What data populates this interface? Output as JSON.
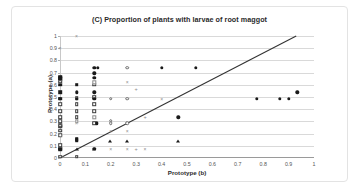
{
  "chart_data": {
    "type": "scatter",
    "title": "(C) Proportion of plants with larvae of root maggot",
    "xlabel": "Prototype (b)",
    "ylabel": "Prototype (a)",
    "xlim": [
      0,
      1
    ],
    "ylim": [
      0,
      1
    ],
    "xticks": [
      "0",
      "0.1",
      "0.2",
      "0.3",
      "0.4",
      "0.5",
      "0.6",
      "0.7",
      "0.8",
      "0.9",
      "1"
    ],
    "yticks": [
      "0",
      "0.1",
      "0.2",
      "0.3",
      "0.4",
      "0.5",
      "0.6",
      "0.7",
      "0.8",
      "0.9",
      "1"
    ],
    "xtick_values": [
      0,
      0.1,
      0.2,
      0.3,
      0.4,
      0.5,
      0.6,
      0.7,
      0.8,
      0.9,
      1
    ],
    "ytick_values": [
      0,
      0.1,
      0.2,
      0.3,
      0.4,
      0.5,
      0.6,
      0.7,
      0.8,
      0.9,
      1
    ],
    "grid": "horizontal",
    "legend": "none",
    "reference_line": {
      "name": "one-to-one-line",
      "from": [
        0,
        0
      ],
      "to": [
        0.93,
        1.0
      ],
      "color": "#333333"
    },
    "series": [
      {
        "name": "filled-squares",
        "marker": "m-filled-sq",
        "points": [
          [
            0,
            0.665
          ],
          [
            0,
            0.655
          ],
          [
            0,
            0.645
          ],
          [
            0,
            0.6
          ],
          [
            0,
            0.54
          ],
          [
            0,
            0.485
          ],
          [
            0,
            0.27
          ],
          [
            0,
            0.255
          ],
          [
            0,
            0.075
          ],
          [
            0,
            0.07
          ],
          [
            0.065,
            0.6
          ],
          [
            0.065,
            0.155
          ],
          [
            0.065,
            0.145
          ]
        ]
      },
      {
        "name": "open-squares",
        "marker": "m-open-sq",
        "points": [
          [
            0,
            0.625
          ],
          [
            0,
            0.44
          ],
          [
            0,
            0.385
          ],
          [
            0,
            0.335
          ],
          [
            0,
            0.3
          ],
          [
            0,
            0.265
          ],
          [
            0,
            0.225
          ],
          [
            0,
            0.185
          ],
          [
            0,
            0.105
          ],
          [
            0,
            0.012
          ],
          [
            0.065,
            0.49
          ],
          [
            0.065,
            0.44
          ],
          [
            0.065,
            0.385
          ],
          [
            0.065,
            0.335
          ],
          [
            0.065,
            0.012
          ],
          [
            0.135,
            0.6
          ],
          [
            0.135,
            0.5
          ],
          [
            0.135,
            0.44
          ],
          [
            0.135,
            0.385
          ],
          [
            0.135,
            0.285
          ]
        ]
      },
      {
        "name": "filled-circles",
        "marker": "m-filled-ci",
        "points": [
          [
            0,
            0.485
          ],
          [
            0.065,
            0.54
          ],
          [
            0.065,
            0.485
          ],
          [
            0.135,
            0.74
          ],
          [
            0.15,
            0.74
          ],
          [
            0.135,
            0.695
          ],
          [
            0.135,
            0.655
          ],
          [
            0.135,
            0.54
          ],
          [
            0.135,
            0.485
          ],
          [
            0.145,
            0.285
          ],
          [
            0.135,
            0.075
          ],
          [
            0.4,
            0.74
          ],
          [
            0.535,
            0.74
          ],
          [
            0.465,
            0.335
          ],
          [
            0.775,
            0.485
          ],
          [
            0.865,
            0.485
          ],
          [
            0.9,
            0.485
          ],
          [
            0.935,
            0.54
          ]
        ]
      },
      {
        "name": "open-circles",
        "marker": "m-open-ci",
        "points": [
          [
            0,
            0.185
          ],
          [
            0.2,
            0.485
          ],
          [
            0.265,
            0.485
          ],
          [
            0.265,
            0.74
          ],
          [
            0.2,
            0.285
          ],
          [
            0.265,
            0.285
          ],
          [
            0.2,
            0.305
          ]
        ]
      },
      {
        "name": "triangles",
        "marker": "m-tri",
        "points": [
          [
            0.195,
            0.14
          ],
          [
            0.265,
            0.14
          ],
          [
            0.465,
            0.14
          ],
          [
            0.065,
            0.075
          ],
          [
            0.135,
            0.075
          ]
        ]
      },
      {
        "name": "cross-markers",
        "marker": "m-cross",
        "points": [
          [
            0.065,
            1.0
          ],
          [
            0,
            0.9
          ],
          [
            0.265,
            0.625
          ],
          [
            0.4,
            0.485
          ],
          [
            0.065,
            0.285
          ],
          [
            0.2,
            0.225
          ],
          [
            0.2,
            0.075
          ],
          [
            0.265,
            0.225
          ],
          [
            0.265,
            0.075
          ],
          [
            0.335,
            0.075
          ]
        ]
      },
      {
        "name": "plus-markers",
        "marker": "m-plus",
        "points": [
          [
            0.3,
            0.565
          ],
          [
            0.335,
            0.335
          ],
          [
            0.3,
            0.075
          ]
        ]
      },
      {
        "name": "gray-squares",
        "marker": "m-gray-sq",
        "points": [
          [
            0.135,
            0.62
          ],
          [
            0.135,
            0.335
          ],
          [
            0.065,
            0.3
          ]
        ]
      }
    ]
  }
}
